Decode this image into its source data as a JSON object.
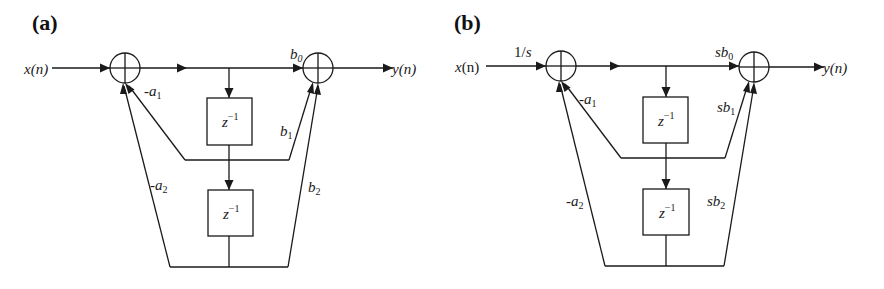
{
  "figure": {
    "panels": [
      {
        "id": "a",
        "label": "(a)",
        "input_label": "x(n)",
        "input_gain": "",
        "output_label": "y(n)",
        "delay_label_base": "z",
        "delay_label_exp": "−1",
        "feedback": [
          {
            "sign": "-",
            "sym": "a",
            "sub": "1"
          },
          {
            "sign": "-",
            "sym": "a",
            "sub": "2"
          }
        ],
        "feedforward": [
          {
            "prefix": "",
            "sym": "b",
            "sub": "0"
          },
          {
            "prefix": "",
            "sym": "b",
            "sub": "1"
          },
          {
            "prefix": "",
            "sym": "b",
            "sub": "2"
          }
        ]
      },
      {
        "id": "b",
        "label": "(b)",
        "input_label": "x(n)",
        "input_gain": "1/s",
        "output_label": "y(n)",
        "delay_label_base": "z",
        "delay_label_exp": "−1",
        "feedback": [
          {
            "sign": "-",
            "sym": "a",
            "sub": "1"
          },
          {
            "sign": "-",
            "sym": "a",
            "sub": "2"
          }
        ],
        "feedforward": [
          {
            "prefix": "s",
            "sym": "b",
            "sub": "0"
          },
          {
            "prefix": "s",
            "sym": "b",
            "sub": "1"
          },
          {
            "prefix": "s",
            "sym": "b",
            "sub": "2"
          }
        ]
      }
    ],
    "colors": {
      "line": "#1a1a1a",
      "background": "#ffffff"
    }
  }
}
